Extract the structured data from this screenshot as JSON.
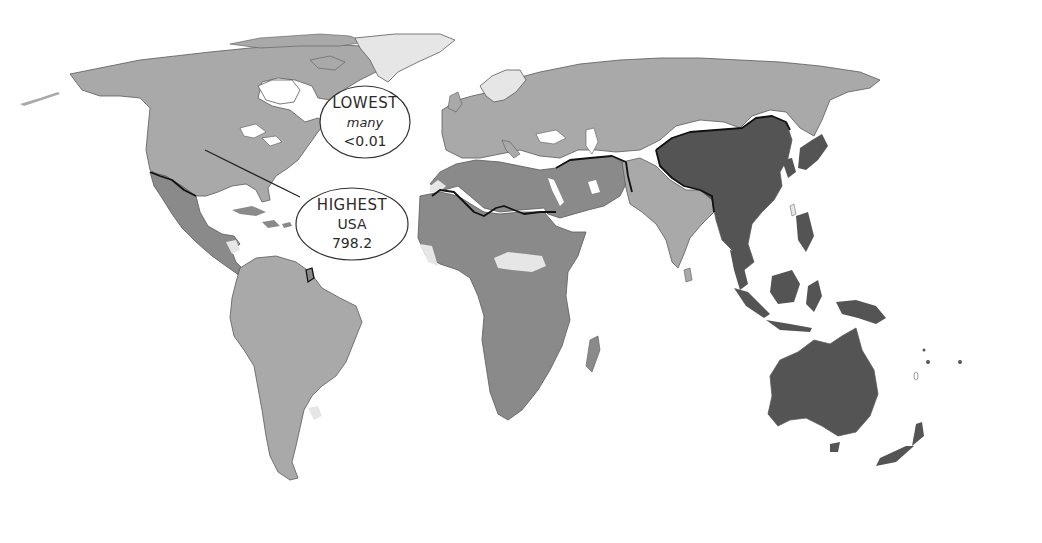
{
  "map": {
    "title": "",
    "shades": {
      "lightest": "#e6e6e6",
      "light": "#a9a9a9",
      "medium": "#8a8a8a",
      "dark": "#545454",
      "border": "#111111",
      "coast": "#5a5a5a",
      "background": "#ffffff"
    },
    "regions": [
      {
        "name": "North America",
        "class": "light"
      },
      {
        "name": "Greenland",
        "class": "lightest"
      },
      {
        "name": "Central America and Caribbean",
        "class": "medium"
      },
      {
        "name": "South America",
        "class": "light"
      },
      {
        "name": "Europe and Russia",
        "class": "light"
      },
      {
        "name": "Scandinavia",
        "class": "lightest"
      },
      {
        "name": "North Africa and Middle East",
        "class": "medium"
      },
      {
        "name": "Sub-Saharan Africa",
        "class": "medium"
      },
      {
        "name": "South Asia",
        "class": "light"
      },
      {
        "name": "East and Southeast Asia",
        "class": "dark"
      },
      {
        "name": "Oceania",
        "class": "dark"
      }
    ],
    "callouts": [
      {
        "id": "lowest",
        "title": "LOWEST",
        "subtitle": "many",
        "value": "<0.01"
      },
      {
        "id": "highest",
        "title": "HIGHEST",
        "subtitle": "USA",
        "value": "798.2"
      }
    ]
  }
}
